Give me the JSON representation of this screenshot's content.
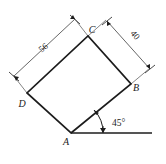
{
  "figure": {
    "shape_type": "square",
    "background_color": "#ffffff",
    "line_color": "#1c1c1c",
    "dimension_color": "#555555"
  },
  "vertices": [
    {
      "name": "A",
      "label": "A",
      "x": 71,
      "y": 133,
      "label_x": 66,
      "label_y": 145
    },
    {
      "name": "B",
      "label": "B",
      "x": 131,
      "y": 84,
      "label_x": 136,
      "label_y": 91
    },
    {
      "name": "C",
      "label": "C",
      "x": 88,
      "y": 36,
      "label_x": 92,
      "label_y": 33
    },
    {
      "name": "D",
      "label": "D",
      "x": 27,
      "y": 93,
      "label_x": 22,
      "label_y": 107
    }
  ],
  "dimensions": [
    {
      "name": "side-DC",
      "label": "56",
      "from_vertex": "D",
      "to_vertex": "C",
      "label_x": 45,
      "label_y": 50,
      "label_rotation": -38
    },
    {
      "name": "side-CB",
      "label": "40",
      "from_vertex": "C",
      "to_vertex": "B",
      "label_x": 133,
      "label_y": 37,
      "label_rotation": 48
    }
  ],
  "angle": {
    "name": "base-angle",
    "label": "45°",
    "value": 45,
    "unit": "degrees",
    "at_vertex": "A",
    "between": [
      "horizontal-ray",
      "side-AB"
    ],
    "label_x": 112,
    "label_y": 126
  },
  "baseline": {
    "name": "horizontal-ray",
    "from_x": 71,
    "from_y": 133,
    "to_x": 152,
    "to_y": 133
  }
}
